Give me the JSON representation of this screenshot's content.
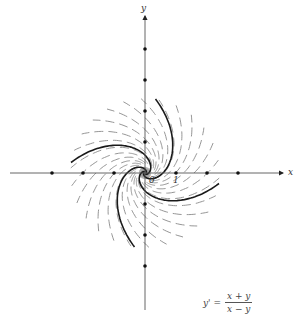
{
  "figure": {
    "x_axis_label": "x",
    "y_axis_label": "y",
    "origin_label": "0",
    "unit_label": "1",
    "equation": {
      "lhs": "y' =",
      "numerator": "x + y",
      "denominator": "x − y"
    },
    "colors": {
      "solution_curve": "#1a1a1a",
      "isocline_dash": "#8a8a8a",
      "axis": "#555555"
    }
  }
}
